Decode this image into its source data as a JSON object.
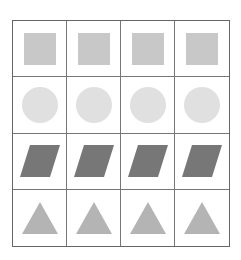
{
  "grid": {
    "rows": 4,
    "cols": 4,
    "rows_data": [
      {
        "shape": "square",
        "color": "#c8c8c8",
        "icon": "square-icon"
      },
      {
        "shape": "circle",
        "color": "#e0e0e0",
        "icon": "circle-icon"
      },
      {
        "shape": "parallelogram",
        "color": "#777777",
        "icon": "parallelogram-icon"
      },
      {
        "shape": "triangle",
        "color": "#b4b4b4",
        "icon": "triangle-icon"
      }
    ]
  }
}
